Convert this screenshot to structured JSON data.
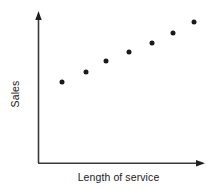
{
  "figure": {
    "background_color": "#ffffff",
    "axis_color": "#3a3a3a",
    "marker_color": "#1a1a1a",
    "width": 221,
    "height": 189
  },
  "axes": {
    "y_axis_name": "y-axis-line",
    "x_axis_name": "x-axis-line",
    "origin_x": 38,
    "origin_y": 163,
    "y_top": 13,
    "x_right": 205,
    "arrowheads": "both"
  },
  "chart_data": {
    "type": "scatter",
    "title": "",
    "subtitle": "",
    "xlabel": "Length of service",
    "ylabel": "Sales",
    "grid": false,
    "legend": null,
    "xticklabels": [],
    "yticklabels": [],
    "xlim": [
      0,
      10
    ],
    "ylim": [
      0,
      10
    ],
    "annotations": [],
    "series": [
      {
        "name": "Sales vs length of service",
        "marker": "circle",
        "marker_color": "#1a1a1a",
        "marker_size": 5,
        "x": [
          1.4,
          2.9,
          4.1,
          5.4,
          6.8,
          8.1,
          9.3
        ],
        "y": [
          4.8,
          6.0,
          6.8,
          7.4,
          8.0,
          8.7,
          9.4
        ],
        "points_px": [
          {
            "cx": 62,
            "cy": 82
          },
          {
            "cx": 86,
            "cy": 72
          },
          {
            "cx": 106,
            "cy": 61
          },
          {
            "cx": 129,
            "cy": 52
          },
          {
            "cx": 152,
            "cy": 43
          },
          {
            "cx": 173,
            "cy": 33
          },
          {
            "cx": 194,
            "cy": 22
          }
        ]
      }
    ]
  }
}
